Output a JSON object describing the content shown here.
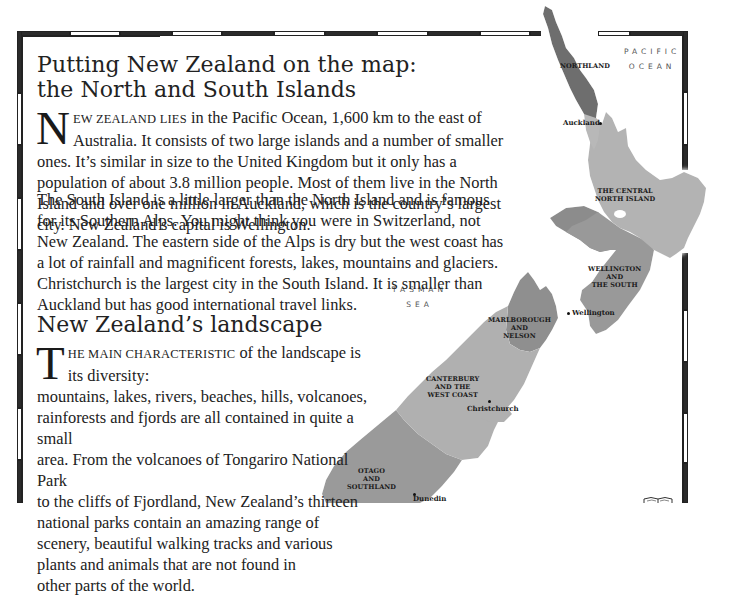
{
  "heading_1": {
    "line1": "Putting New Zealand on the map:",
    "line2": "the North and South Islands"
  },
  "paragraph_1": {
    "dropcap": "N",
    "lead_smallcaps": "EW ZEALAND LIES",
    "text": " in the Pacific Ocean, 1,600 km to the east of Australia. It consists of two large islands and a number of smaller ones. It’s similar in size to the United Kingdom but it only has a population of about 3.8 million people. Most of them live in the North Island and over one million in Auckland, which is the country’s largest city. New Zealand’s capital is Wellington."
  },
  "paragraph_2": {
    "text": "The South Island is a little larger than the North Island and is famous for its Southern Alps. You might think you were in Switzerland, not New Zealand. The eastern side of the Alps is dry but the west coast has a lot of rainfall and magnificent forests, lakes, mountains and glaciers. Christchurch is the largest city in the South Island. It is smaller than Auckland but has good international travel links."
  },
  "heading_2": "New Zealand’s landscape",
  "paragraph_3": {
    "dropcap": "T",
    "lead_smallcaps": "HE MAIN CHARACTERISTIC",
    "line1_rest": " of the landscape is its diversity:",
    "line2": "mountains, lakes, rivers, beaches, hills, volcanoes,",
    "line3": "rainforests and fjords are all contained in quite a small",
    "line4": "area.  From the volcanoes of Tongariro National Park",
    "line5": "to the cliffs of Fjordland, New Zealand’s thirteen",
    "line6": "national parks contain an amazing range of",
    "line7": "scenery, beautiful walking tracks and various",
    "line8": "plants and animals that are not found in",
    "line9": "other parts of the world."
  },
  "map": {
    "oceans": {
      "pacific": [
        "PACIFIC",
        "OCEAN"
      ],
      "tasman": [
        "TASMAN",
        "SEA"
      ]
    },
    "regions": {
      "northland": "NORTHLAND",
      "central_north": [
        "THE CENTRAL",
        "NORTH ISLAND"
      ],
      "wellington_south": [
        "WELLINGTON",
        "AND",
        "THE SOUTH"
      ],
      "marlborough": [
        "MARLBOROUGH",
        "AND",
        "NELSON"
      ],
      "canterbury": [
        "CANTERBURY",
        "AND THE",
        "WEST COAST"
      ],
      "otago": [
        "OTAGO",
        "AND",
        "SOUTHLAND"
      ]
    },
    "cities": {
      "auckland": "Auckland",
      "wellington": "Wellington",
      "christchurch": "Christchurch",
      "dunedin": "Dunedin"
    },
    "colors": {
      "northland": "#6e6e6e",
      "central_north": "#b3b3b3",
      "wellington_west": "#8c8c8c",
      "wellington_south": "#999999",
      "marlborough": "#8f8f8f",
      "canterbury": "#b0b0b0",
      "otago": "#9a9a9a"
    }
  }
}
